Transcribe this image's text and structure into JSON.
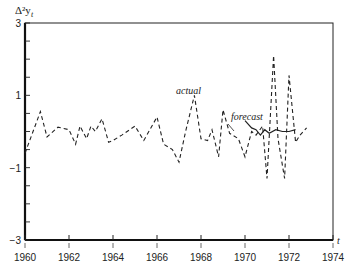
{
  "chart_data": {
    "type": "line",
    "title": "",
    "ylabel": "Δ²y_t",
    "xlabel": "t",
    "xlim": [
      1960,
      1974
    ],
    "ylim": [
      -3,
      3
    ],
    "x_ticks": [
      1960,
      1962,
      1964,
      1966,
      1968,
      1970,
      1972,
      1974
    ],
    "y_ticks": [
      3,
      1,
      -1,
      -3
    ],
    "grid": false,
    "annotations": [
      {
        "text": "actual",
        "x": 1967.6,
        "y": 1.2
      },
      {
        "text": "forecast",
        "x": 1970.2,
        "y": 0.5
      }
    ],
    "series": [
      {
        "name": "actual",
        "style": "dashed",
        "x": [
          1960.0,
          1960.7,
          1961.0,
          1961.5,
          1962.0,
          1962.3,
          1962.5,
          1962.8,
          1963.0,
          1963.2,
          1963.5,
          1963.8,
          1964.0,
          1964.4,
          1965.0,
          1965.4,
          1966.0,
          1966.3,
          1966.7,
          1967.0,
          1967.3,
          1967.7,
          1968.0,
          1968.3,
          1968.5,
          1968.8,
          1969.0,
          1969.3,
          1969.7,
          1970.0,
          1970.3,
          1970.5,
          1970.8,
          1971.0,
          1971.3,
          1971.5,
          1971.8,
          1972.0,
          1972.3,
          1972.5,
          1972.8
        ],
        "y": [
          -0.6,
          0.55,
          -0.15,
          0.12,
          0.05,
          -0.35,
          0.15,
          -0.2,
          0.15,
          0.0,
          0.35,
          -0.3,
          -0.25,
          -0.1,
          0.15,
          -0.25,
          0.4,
          -0.35,
          -0.5,
          -0.85,
          0.0,
          1.0,
          -0.2,
          -0.25,
          0.05,
          -0.7,
          0.6,
          -0.05,
          -0.2,
          -0.7,
          0.0,
          -0.1,
          0.15,
          -1.3,
          2.1,
          -0.2,
          -1.3,
          1.55,
          -0.3,
          -0.1,
          0.1
        ]
      },
      {
        "name": "forecast",
        "style": "solid",
        "x": [
          1970.0,
          1970.3,
          1970.5,
          1970.7,
          1970.9,
          1971.1,
          1971.4,
          1971.7,
          1972.0,
          1972.3
        ],
        "y": [
          0.3,
          0.1,
          0.05,
          -0.1,
          0.05,
          -0.05,
          0.05,
          0.0,
          0.0,
          0.05
        ]
      }
    ]
  },
  "labels": {
    "ylabel": "Δ²y",
    "ylabel_sub": "t",
    "xlabel": "t",
    "actual": "actual",
    "forecast": "forecast",
    "y_ticks": [
      "3",
      "1",
      "−1",
      "−3"
    ],
    "x_ticks": [
      "1960",
      "1962",
      "1964",
      "1966",
      "1968",
      "1970",
      "1972",
      "1974"
    ]
  }
}
